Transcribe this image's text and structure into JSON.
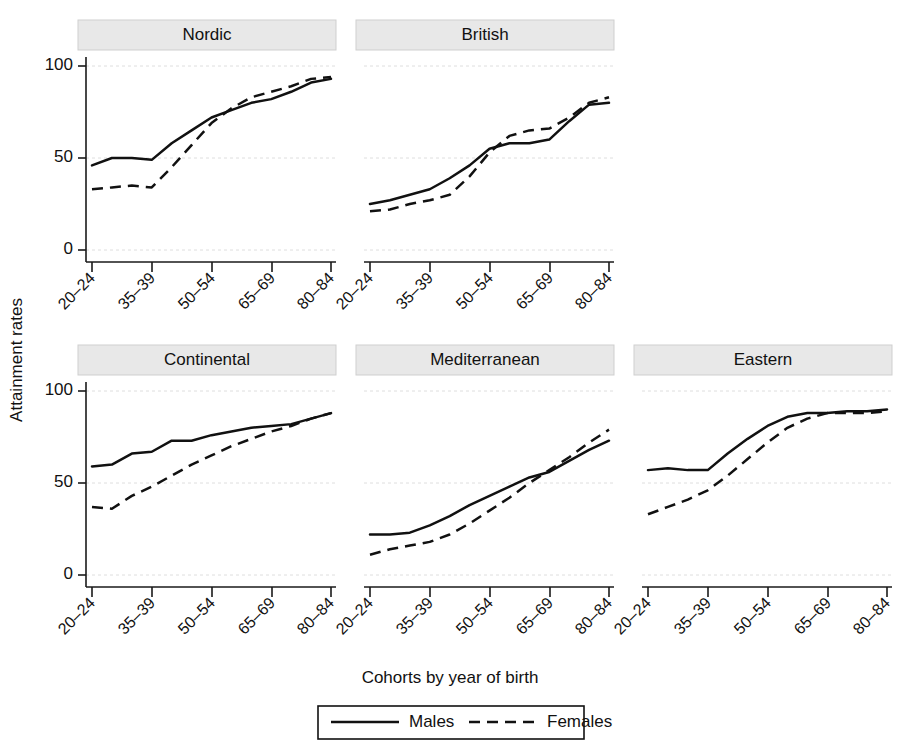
{
  "chart_data": {
    "type": "line",
    "title": "",
    "xlabel": "Cohorts by year of birth",
    "ylabel": "Attainment rates",
    "ylim": [
      0,
      110
    ],
    "yticks": [
      0,
      50,
      100
    ],
    "grid": true,
    "legend_position": "bottom-center",
    "x": [
      "20–24",
      "25–29",
      "30–34",
      "35–39",
      "40–44",
      "45–49",
      "50–54",
      "55–59",
      "60–64",
      "65–69",
      "70–74",
      "75–79",
      "80–84"
    ],
    "xtick_labels": [
      "20–24",
      "35–39",
      "50–54",
      "65–69",
      "80–84"
    ],
    "xtick_indices": [
      0,
      3,
      6,
      9,
      12
    ],
    "legend": [
      {
        "name": "Males",
        "style": "solid"
      },
      {
        "name": "Females",
        "style": "dashed"
      }
    ],
    "panels": [
      {
        "title": "Nordic",
        "row": 0,
        "col": 0,
        "series": [
          {
            "name": "Males",
            "values": [
              46,
              50,
              50,
              49,
              58,
              65,
              72,
              76,
              80,
              82,
              86,
              91,
              93
            ]
          },
          {
            "name": "Females",
            "values": [
              33,
              34,
              35,
              34,
              45,
              57,
              69,
              77,
              83,
              86,
              89,
              93,
              94
            ]
          }
        ]
      },
      {
        "title": "British",
        "row": 0,
        "col": 1,
        "series": [
          {
            "name": "Males",
            "values": [
              25,
              27,
              30,
              33,
              39,
              46,
              55,
              58,
              58,
              60,
              70,
              79,
              80
            ]
          },
          {
            "name": "Females",
            "values": [
              21,
              22,
              25,
              27,
              30,
              40,
              53,
              62,
              65,
              66,
              72,
              80,
              83
            ]
          }
        ]
      },
      {
        "title": "Continental",
        "row": 1,
        "col": 0,
        "series": [
          {
            "name": "Males",
            "values": [
              59,
              60,
              66,
              67,
              73,
              73,
              76,
              78,
              80,
              81,
              82,
              85,
              88
            ]
          },
          {
            "name": "Females",
            "values": [
              37,
              36,
              43,
              48,
              54,
              60,
              65,
              70,
              74,
              78,
              81,
              85,
              88
            ]
          }
        ]
      },
      {
        "title": "Mediterranean",
        "row": 1,
        "col": 1,
        "series": [
          {
            "name": "Males",
            "values": [
              22,
              22,
              23,
              27,
              32,
              38,
              43,
              48,
              53,
              56,
              62,
              68,
              73
            ]
          },
          {
            "name": "Females",
            "values": [
              11,
              14,
              16,
              18,
              22,
              28,
              35,
              42,
              50,
              57,
              64,
              72,
              79
            ]
          }
        ]
      },
      {
        "title": "Eastern",
        "row": 1,
        "col": 2,
        "series": [
          {
            "name": "Males",
            "values": [
              57,
              58,
              57,
              57,
              66,
              74,
              81,
              86,
              88,
              88,
              89,
              89,
              90
            ]
          },
          {
            "name": "Females",
            "values": [
              33,
              37,
              41,
              46,
              54,
              63,
              72,
              80,
              85,
              88,
              88,
              88,
              89
            ]
          }
        ]
      }
    ]
  },
  "figure": {
    "axis_color": "#111111",
    "grid_color": "#dedede",
    "strip_fill": "#e8e8e8",
    "series_color": "#111111"
  }
}
